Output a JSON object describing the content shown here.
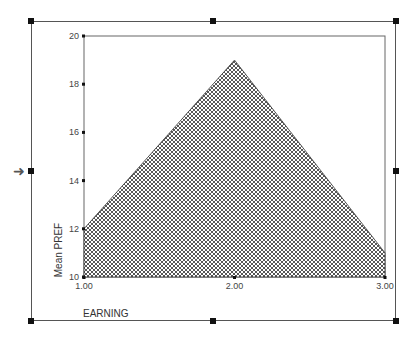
{
  "chart_data": {
    "type": "area",
    "title": "",
    "xlabel": "EARNING",
    "ylabel": "Mean PREF",
    "x": [
      1.0,
      2.0,
      3.0
    ],
    "categories": [
      "1.00",
      "2.00",
      "3.00"
    ],
    "values": [
      12,
      19,
      11
    ],
    "ylim": [
      10,
      20
    ],
    "yticks": [
      "10",
      "12",
      "14",
      "16",
      "18",
      "20"
    ],
    "xticks": [
      "1.00",
      "2.00",
      "3.00"
    ],
    "grid": false,
    "legend": null,
    "fill_pattern": "crosshatch"
  },
  "ui": {
    "selection_arrow": "right-arrow-icon"
  },
  "colors": {
    "fill_hatch": "#444444",
    "axis": "#555555",
    "frame": "#555555"
  }
}
